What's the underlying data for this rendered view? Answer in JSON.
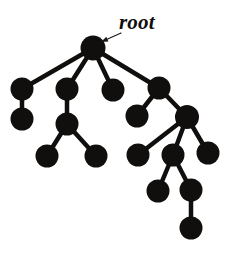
{
  "figure": {
    "kind": "tree-diagram",
    "title": "",
    "background_color": "#ffffff",
    "ink_color": "#100f0d",
    "width": 231,
    "height": 258
  },
  "annotation": {
    "root_label": "root",
    "pointer": {
      "from_x": 121,
      "from_y": 33,
      "to_x": 101,
      "to_y": 42
    }
  },
  "tree": {
    "node_radius": 11,
    "root_radius": 12.5,
    "edge_width": 4.5,
    "nodes": [
      {
        "id": "n0",
        "label": "root",
        "x": 93,
        "y": 48,
        "r": 12.5,
        "depth": 0
      },
      {
        "id": "n1",
        "label": "",
        "x": 22,
        "y": 89,
        "r": 11.5,
        "depth": 1
      },
      {
        "id": "n2",
        "label": "",
        "x": 67,
        "y": 89,
        "r": 11.5,
        "depth": 1
      },
      {
        "id": "n3",
        "label": "",
        "x": 113,
        "y": 90,
        "r": 11.5,
        "depth": 1
      },
      {
        "id": "n4",
        "label": "",
        "x": 159,
        "y": 88,
        "r": 11.5,
        "depth": 1
      },
      {
        "id": "n5",
        "label": "",
        "x": 22,
        "y": 119,
        "r": 11.5,
        "depth": 2
      },
      {
        "id": "n6",
        "label": "",
        "x": 67,
        "y": 124,
        "r": 11.5,
        "depth": 2
      },
      {
        "id": "n7",
        "label": "",
        "x": 137,
        "y": 116,
        "r": 11.5,
        "depth": 2
      },
      {
        "id": "n8",
        "label": "",
        "x": 187,
        "y": 117,
        "r": 12,
        "depth": 2
      },
      {
        "id": "n9",
        "label": "",
        "x": 47,
        "y": 156,
        "r": 11.5,
        "depth": 3
      },
      {
        "id": "n10",
        "label": "",
        "x": 96,
        "y": 156,
        "r": 11.5,
        "depth": 3
      },
      {
        "id": "n11",
        "label": "",
        "x": 138,
        "y": 155,
        "r": 11.5,
        "depth": 3
      },
      {
        "id": "n12",
        "label": "",
        "x": 173,
        "y": 155,
        "r": 11.5,
        "depth": 3
      },
      {
        "id": "n13",
        "label": "",
        "x": 208,
        "y": 153,
        "r": 11.5,
        "depth": 3
      },
      {
        "id": "n14",
        "label": "",
        "x": 158,
        "y": 191,
        "r": 11.5,
        "depth": 4
      },
      {
        "id": "n15",
        "label": "",
        "x": 191,
        "y": 190,
        "r": 11.5,
        "depth": 4
      },
      {
        "id": "n16",
        "label": "",
        "x": 191,
        "y": 228,
        "r": 11.5,
        "depth": 5
      }
    ],
    "edges": [
      {
        "from": "n0",
        "to": "n1"
      },
      {
        "from": "n0",
        "to": "n2"
      },
      {
        "from": "n0",
        "to": "n3"
      },
      {
        "from": "n0",
        "to": "n4"
      },
      {
        "from": "n1",
        "to": "n5"
      },
      {
        "from": "n2",
        "to": "n6"
      },
      {
        "from": "n4",
        "to": "n7"
      },
      {
        "from": "n4",
        "to": "n8"
      },
      {
        "from": "n6",
        "to": "n9"
      },
      {
        "from": "n6",
        "to": "n10"
      },
      {
        "from": "n8",
        "to": "n11"
      },
      {
        "from": "n8",
        "to": "n12"
      },
      {
        "from": "n8",
        "to": "n13"
      },
      {
        "from": "n12",
        "to": "n14"
      },
      {
        "from": "n12",
        "to": "n15"
      },
      {
        "from": "n15",
        "to": "n16"
      }
    ]
  }
}
